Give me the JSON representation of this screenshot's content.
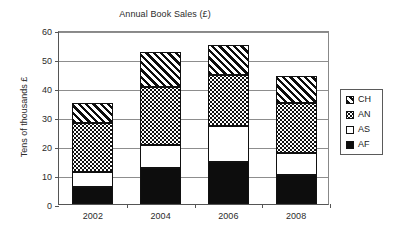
{
  "chart_data": {
    "type": "bar",
    "subtype": "stacked-column",
    "title": "Annual Book Sales (£)",
    "xlabel": "",
    "ylabel": "Tens of thousands £",
    "categories": [
      "2002",
      "2004",
      "2006",
      "2008"
    ],
    "ylim": [
      0,
      60
    ],
    "yticks": [
      0,
      10,
      20,
      30,
      40,
      50,
      60
    ],
    "ytick_labels": [
      "0",
      "10",
      "20",
      "30",
      "40",
      "50",
      "60"
    ],
    "grid": "horizontal",
    "legend_position": "right",
    "stack_order_bottom_to_top": [
      "AF",
      "AS",
      "AN",
      "CH"
    ],
    "series": [
      {
        "name": "AF",
        "pattern": "solid-black",
        "values": [
          6,
          12.5,
          14.5,
          10
        ]
      },
      {
        "name": "AS",
        "pattern": "white-empty",
        "values": [
          5,
          8,
          12.5,
          7.5
        ]
      },
      {
        "name": "AN",
        "pattern": "dotted-stipple",
        "values": [
          17,
          20,
          17.5,
          17.5
        ]
      },
      {
        "name": "CH",
        "pattern": "diagonal-hatch",
        "values": [
          7,
          12,
          10.5,
          9
        ]
      }
    ],
    "cumulative_tops": {
      "2002": [
        6,
        11,
        28,
        35
      ],
      "2004": [
        12.5,
        20.5,
        40.5,
        52.5
      ],
      "2006": [
        14.5,
        27,
        44.5,
        55
      ],
      "2008": [
        10,
        17.5,
        35,
        44
      ]
    },
    "totals": [
      35,
      52.5,
      55,
      44
    ]
  },
  "legend": {
    "items": [
      {
        "label": "CH",
        "pattern": "diagonal-hatch"
      },
      {
        "label": "AN",
        "pattern": "dotted-stipple"
      },
      {
        "label": "AS",
        "pattern": "white-empty"
      },
      {
        "label": "AF",
        "pattern": "solid-black"
      }
    ]
  },
  "colors": {
    "ink": "#0d0d0d",
    "gridline": "#8d8d8d",
    "axis": "#555555",
    "background": "#ffffff"
  }
}
